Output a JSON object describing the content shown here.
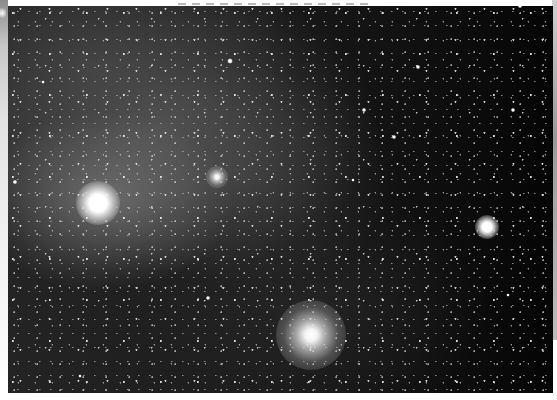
{
  "image": {
    "description": "Grayscale wide-field astrophotograph of a dense star field with diffuse nebulosity in the upper-left, a very bright star lower-left, a bright star on the right, a compact cluster near center-left and a large globular cluster at bottom-center",
    "colors": {
      "background": "#0b0b0b",
      "nebula": "#8c8c8c",
      "stars": "#ffffff",
      "frame": "#ffffff"
    },
    "caption_strip": {
      "text_visible": false
    },
    "objects": [
      {
        "name": "bright-star-lower-left",
        "type": "star",
        "x": 98,
        "y": 203,
        "size": 44
      },
      {
        "name": "bright-star-right",
        "type": "star",
        "x": 487,
        "y": 227,
        "size": 24
      },
      {
        "name": "compact-cluster",
        "type": "cluster",
        "x": 217,
        "y": 177,
        "size": 22
      },
      {
        "name": "globular-cluster",
        "type": "cluster",
        "x": 311,
        "y": 335,
        "size": 70
      },
      {
        "name": "star-1",
        "type": "small-star",
        "x": 230,
        "y": 61,
        "size": 5
      },
      {
        "name": "star-2",
        "type": "small-star",
        "x": 418,
        "y": 67,
        "size": 4
      },
      {
        "name": "star-3",
        "type": "small-star",
        "x": 364,
        "y": 110,
        "size": 4
      },
      {
        "name": "star-4",
        "type": "small-star",
        "x": 513,
        "y": 110,
        "size": 4
      },
      {
        "name": "star-5",
        "type": "small-star",
        "x": 394,
        "y": 137,
        "size": 4
      },
      {
        "name": "star-6",
        "type": "small-star",
        "x": 15,
        "y": 182,
        "size": 4
      },
      {
        "name": "star-7",
        "type": "small-star",
        "x": 353,
        "y": 180,
        "size": 3
      },
      {
        "name": "star-8",
        "type": "small-star",
        "x": 208,
        "y": 298,
        "size": 4
      },
      {
        "name": "star-9",
        "type": "small-star",
        "x": 520,
        "y": 6,
        "size": 4
      },
      {
        "name": "star-10",
        "type": "small-star",
        "x": 43,
        "y": 82,
        "size": 3
      },
      {
        "name": "star-11",
        "type": "small-star",
        "x": 508,
        "y": 295,
        "size": 3
      },
      {
        "name": "star-12",
        "type": "small-star",
        "x": 80,
        "y": 376,
        "size": 3
      }
    ]
  }
}
